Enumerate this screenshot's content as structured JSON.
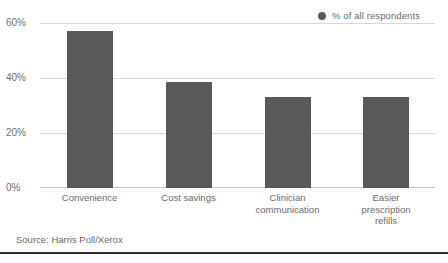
{
  "legend": {
    "marker_icon": "legend-dot-icon",
    "label": "% of all respondents",
    "color": "#5b5b5b"
  },
  "source": {
    "text": "Source: Harris Poll/Xerox"
  },
  "axis": {
    "y_ticks": [
      "60%",
      "40%",
      "20%",
      "0%"
    ]
  },
  "chart_data": {
    "type": "bar",
    "title": "",
    "subtitle": "",
    "xlabel": "",
    "ylabel": "",
    "categories": [
      "Convenience",
      "Cost savings",
      "Clinician communication",
      "Easier prescription refills"
    ],
    "category_lines": [
      [
        "Convenience"
      ],
      [
        "Cost savings"
      ],
      [
        "Clinician",
        "communication"
      ],
      [
        "Easier",
        "prescription",
        "refills"
      ]
    ],
    "series": [
      {
        "name": "% of all respondents",
        "values": [
          57,
          38.5,
          33,
          33
        ],
        "color": "#595959"
      }
    ],
    "values": [
      57,
      38.5,
      33,
      33
    ],
    "ylim": [
      0,
      60
    ],
    "ytick_values": [
      60,
      40,
      20,
      0
    ],
    "ytick_labels": [
      "60%",
      "40%",
      "20%",
      "0%"
    ],
    "grid": true,
    "grid_axis": "y",
    "legend_position": "top-right",
    "bar_color": "#595959",
    "background": "#ffffff"
  }
}
